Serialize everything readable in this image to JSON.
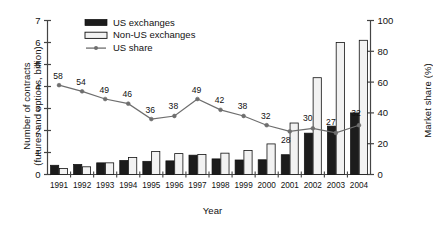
{
  "chart_data": {
    "type": "bar",
    "title": "",
    "xlabel": "Year",
    "ylabel": "Number of contracts (futures and options, billion)",
    "ylabel_right": "Market share (%)",
    "categories": [
      "1991",
      "1992",
      "1993",
      "1994",
      "1995",
      "1996",
      "1997",
      "1998",
      "1999",
      "2000",
      "2001",
      "2002",
      "2003",
      "2004"
    ],
    "ylim": [
      0,
      7
    ],
    "yticks": [
      0,
      1,
      2,
      3,
      4,
      5,
      6,
      7
    ],
    "ylim_right": [
      0,
      100
    ],
    "yticks_right": [
      0,
      20,
      40,
      60,
      80,
      100
    ],
    "grid": false,
    "legend_position": "top-left",
    "series": [
      {
        "name": "US exchanges",
        "type": "bar",
        "axis": "left",
        "color": "#1c1c1c",
        "values": [
          0.42,
          0.46,
          0.53,
          0.64,
          0.6,
          0.62,
          0.88,
          0.71,
          0.66,
          0.67,
          0.9,
          1.88,
          2.2,
          2.8
        ]
      },
      {
        "name": "Non-US exchanges",
        "type": "bar",
        "axis": "left",
        "color": "#f2f2f2",
        "values": [
          0.27,
          0.35,
          0.53,
          0.77,
          1.05,
          0.95,
          0.91,
          0.97,
          1.09,
          1.39,
          2.34,
          4.4,
          6.0,
          6.1
        ]
      },
      {
        "name": "US share",
        "type": "line",
        "axis": "right",
        "color": "#6e6e6e",
        "values": [
          58,
          54,
          49,
          46,
          36,
          38,
          49,
          42,
          38,
          32,
          28,
          30,
          27,
          32
        ],
        "labels": [
          "58",
          "54",
          "49",
          "46",
          "36",
          "38",
          "49",
          "42",
          "38",
          "32",
          "28",
          "30",
          "27",
          "32"
        ]
      }
    ]
  },
  "legend": {
    "items": [
      {
        "label": "US exchanges",
        "swatch": "filled-black"
      },
      {
        "label": "Non-US exchanges",
        "swatch": "outlined-white"
      },
      {
        "label": "US share",
        "swatch": "line-marker"
      }
    ]
  },
  "axes": {
    "left_title": "Number of contracts",
    "left_title_2": "(futures and options, billion)",
    "right_title": "Market share (%)",
    "x_title": "Year"
  },
  "colors": {
    "us_bar": "#1c1c1c",
    "nonus_bar": "#f2f2f2",
    "line": "#6e6e6e",
    "axis": "#444444",
    "text": "#111111"
  }
}
